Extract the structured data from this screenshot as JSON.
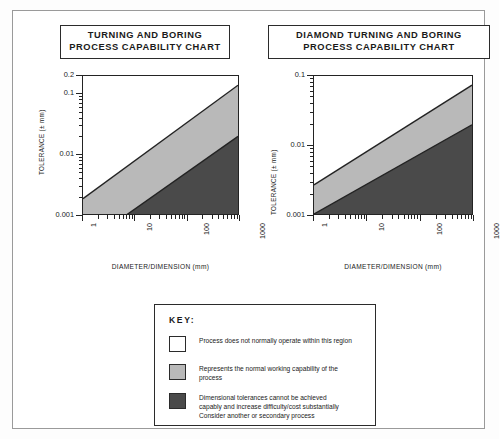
{
  "charts": [
    {
      "id": "turning-boring",
      "title_lines": [
        "TURNING AND BORING",
        "PROCESS CAPABILITY CHART"
      ],
      "ylabel": "TOLERANCE (± mm)",
      "xlabel": "DIAMETER/DIMENSION (mm)",
      "y_ticks": [
        "0.2",
        "0.1",
        "0.01",
        "0.001"
      ],
      "x_ticks": [
        "1",
        "10",
        "100",
        "1000"
      ]
    },
    {
      "id": "diamond-turning-boring",
      "title_lines": [
        "DIAMOND TURNING AND BORING",
        "PROCESS CAPABILITY CHART"
      ],
      "ylabel": "TOLERANCE (± mm)",
      "xlabel": "DIAMETER/DIMENSION (mm)",
      "y_ticks": [
        "0.1",
        "0.01",
        "0.001"
      ],
      "x_ticks": [
        "1",
        "10",
        "100",
        "1000"
      ]
    }
  ],
  "key": {
    "title": "KEY:",
    "entries": [
      {
        "swatch": "#ffffff",
        "text": "Process does not normally operate within this region"
      },
      {
        "swatch": "#b9b9b9",
        "text": "Represents the normal working capability of the\nprocess"
      },
      {
        "swatch": "#4a4a4a",
        "text": "Dimensional tolerances cannot be achieved\ncapably and increase difficulty/cost substantially\nConsider another or secondary process"
      }
    ]
  },
  "colors": {
    "white_region": "#ffffff",
    "grey_region": "#b9b9b9",
    "dark_region": "#4a4a4a",
    "line": "#232323",
    "frame": "#9a9a9a"
  },
  "chart_data": [
    {
      "type": "area",
      "title": "TURNING AND BORING PROCESS CAPABILITY CHART",
      "xlabel": "DIAMETER/DIMENSION (mm)",
      "ylabel": "TOLERANCE (± mm)",
      "xscale": "log",
      "yscale": "log",
      "xlim": [
        1,
        1000
      ],
      "ylim": [
        0.001,
        0.2
      ],
      "xticks": [
        1,
        10,
        100,
        1000
      ],
      "yticks": [
        0.001,
        0.01,
        0.1,
        0.2
      ],
      "grid": false,
      "legend": "external key box",
      "series": [
        {
          "name": "upper boundary (white / grey divide)",
          "x": [
            1,
            1000
          ],
          "y": [
            0.013,
            0.2
          ]
        },
        {
          "name": "lower boundary (grey / dark divide)",
          "x": [
            1,
            1000
          ],
          "y": [
            0.0028,
            0.056
          ]
        }
      ],
      "regions": [
        {
          "name": "Process does not normally operate within this region",
          "fill": "#ffffff",
          "position": "above upper boundary"
        },
        {
          "name": "Represents the normal working capability of the process",
          "fill": "#b9b9b9",
          "position": "between boundaries"
        },
        {
          "name": "Dimensional tolerances cannot be achieved capably and increase difficulty/cost substantially",
          "fill": "#4a4a4a",
          "position": "below lower boundary"
        }
      ]
    },
    {
      "type": "area",
      "title": "DIAMOND TURNING AND BORING PROCESS CAPABILITY CHART",
      "xlabel": "DIAMETER/DIMENSION (mm)",
      "ylabel": "TOLERANCE (± mm)",
      "xscale": "log",
      "yscale": "log",
      "xlim": [
        1,
        1000
      ],
      "ylim": [
        0.001,
        0.1
      ],
      "xticks": [
        1,
        10,
        100,
        1000
      ],
      "yticks": [
        0.001,
        0.01,
        0.1
      ],
      "grid": false,
      "legend": "external key box",
      "series": [
        {
          "name": "upper boundary (white / grey divide)",
          "x": [
            1,
            1000
          ],
          "y": [
            0.004,
            0.08
          ]
        },
        {
          "name": "lower boundary (grey / dark divide)",
          "x": [
            1,
            1000
          ],
          "y": [
            0.001,
            0.0225
          ]
        }
      ],
      "regions": [
        {
          "name": "Process does not normally operate within this region",
          "fill": "#ffffff",
          "position": "above upper boundary"
        },
        {
          "name": "Represents the normal working capability of the process",
          "fill": "#b9b9b9",
          "position": "between boundaries"
        },
        {
          "name": "Dimensional tolerances cannot be achieved capably and increase difficulty/cost substantially",
          "fill": "#4a4a4a",
          "position": "below lower boundary"
        }
      ]
    }
  ]
}
